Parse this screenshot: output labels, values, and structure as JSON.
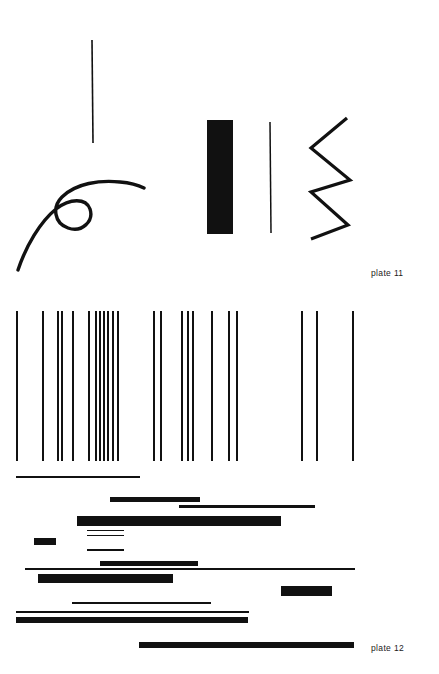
{
  "page": {
    "width": 439,
    "height": 674,
    "background_color": "#ffffff",
    "ink_color": "#111111"
  },
  "plates": [
    {
      "id": "plate-11",
      "label": "plate 11",
      "label_position": {
        "x": 371,
        "y": 268
      },
      "marks": [
        {
          "name": "vertical-stroke-thin-tall",
          "kind": "line",
          "x1": 92,
          "y1": 40,
          "x2": 93,
          "y2": 143,
          "stroke_width": 1.6
        },
        {
          "name": "looping-curve",
          "kind": "path",
          "d": "M 18 270 C 26 246 40 222 56 209 C 70 198 86 198 90 209 C 94 221 82 233 68 228 C 54 223 52 207 62 197 C 76 183 100 180 120 182 C 132 183 140 186 144 188",
          "stroke_width": 3.4
        },
        {
          "name": "thick-solid-bar-vertical",
          "kind": "rect",
          "x": 207,
          "y": 120,
          "width": 26,
          "height": 114
        },
        {
          "name": "hairline-vertical-stroke",
          "kind": "line",
          "x1": 270,
          "y1": 122,
          "x2": 271,
          "y2": 233,
          "stroke_width": 1.5
        },
        {
          "name": "zigzag-stroke",
          "kind": "polyline",
          "points": "347,118 311,148 350,180 311,192 348,225 311,239",
          "stroke_width": 3.2
        }
      ]
    },
    {
      "id": "plate-12",
      "label": "plate 12",
      "label_position": {
        "x": 371,
        "y": 643
      },
      "vertical_lines": [
        {
          "x": 16,
          "y": 311,
          "height": 150,
          "width": 1.7
        },
        {
          "x": 42,
          "y": 311,
          "height": 150,
          "width": 1.8
        },
        {
          "x": 57,
          "y": 311,
          "height": 150,
          "width": 1.6
        },
        {
          "x": 61,
          "y": 311,
          "height": 150,
          "width": 1.6
        },
        {
          "x": 72,
          "y": 311,
          "height": 150,
          "width": 1.8
        },
        {
          "x": 88,
          "y": 311,
          "height": 150,
          "width": 1.9
        },
        {
          "x": 95,
          "y": 311,
          "height": 150,
          "width": 1.6
        },
        {
          "x": 99,
          "y": 311,
          "height": 150,
          "width": 1.5
        },
        {
          "x": 103,
          "y": 311,
          "height": 150,
          "width": 1.5
        },
        {
          "x": 107,
          "y": 311,
          "height": 150,
          "width": 1.6
        },
        {
          "x": 112,
          "y": 311,
          "height": 150,
          "width": 1.8
        },
        {
          "x": 117,
          "y": 311,
          "height": 150,
          "width": 1.6
        },
        {
          "x": 153,
          "y": 311,
          "height": 150,
          "width": 1.8
        },
        {
          "x": 160,
          "y": 311,
          "height": 150,
          "width": 1.8
        },
        {
          "x": 181,
          "y": 311,
          "height": 150,
          "width": 1.8
        },
        {
          "x": 187,
          "y": 311,
          "height": 150,
          "width": 1.8
        },
        {
          "x": 192,
          "y": 311,
          "height": 150,
          "width": 1.8
        },
        {
          "x": 211,
          "y": 311,
          "height": 150,
          "width": 1.8
        },
        {
          "x": 228,
          "y": 311,
          "height": 150,
          "width": 1.8
        },
        {
          "x": 236,
          "y": 311,
          "height": 150,
          "width": 1.8
        },
        {
          "x": 301,
          "y": 311,
          "height": 150,
          "width": 1.8
        },
        {
          "x": 316,
          "y": 311,
          "height": 150,
          "width": 1.8
        },
        {
          "x": 352,
          "y": 311,
          "height": 150,
          "width": 1.8
        }
      ],
      "horizontal_bars": [
        {
          "name": "bar-hairline-top",
          "x": 16,
          "y": 476,
          "width": 124,
          "height": 1.6
        },
        {
          "name": "bar-medium-upper-left",
          "x": 110,
          "y": 497,
          "width": 90,
          "height": 5.0
        },
        {
          "name": "bar-thin-upper-right",
          "x": 179,
          "y": 505,
          "width": 136,
          "height": 2.6
        },
        {
          "name": "bar-heavy-wide",
          "x": 77,
          "y": 516,
          "width": 204,
          "height": 10.0
        },
        {
          "name": "bar-hairline-pair-upper",
          "x": 87,
          "y": 530,
          "width": 37,
          "height": 1.4
        },
        {
          "name": "bar-hairline-pair-lower",
          "x": 87,
          "y": 535,
          "width": 37,
          "height": 1.4
        },
        {
          "name": "bar-small-block-left",
          "x": 34,
          "y": 538,
          "width": 22,
          "height": 7.0
        },
        {
          "name": "bar-thin-short-mid",
          "x": 87,
          "y": 549,
          "width": 37,
          "height": 1.8
        },
        {
          "name": "bar-medium-center",
          "x": 100,
          "y": 561,
          "width": 98,
          "height": 5.0
        },
        {
          "name": "bar-hairline-full-width",
          "x": 25,
          "y": 568,
          "width": 330,
          "height": 1.5
        },
        {
          "name": "bar-heavy-left",
          "x": 38,
          "y": 574,
          "width": 135,
          "height": 9.0
        },
        {
          "name": "bar-block-right",
          "x": 281,
          "y": 586,
          "width": 51,
          "height": 10.0
        },
        {
          "name": "bar-thin-long-lower",
          "x": 72,
          "y": 602,
          "width": 139,
          "height": 1.8
        },
        {
          "name": "bar-hairline-lower",
          "x": 16,
          "y": 611,
          "width": 233,
          "height": 1.5
        },
        {
          "name": "bar-heavy-bottom-left",
          "x": 16,
          "y": 617,
          "width": 232,
          "height": 6.0
        },
        {
          "name": "bar-heavy-bottom-right",
          "x": 139,
          "y": 642,
          "width": 215,
          "height": 5.5
        }
      ]
    }
  ]
}
